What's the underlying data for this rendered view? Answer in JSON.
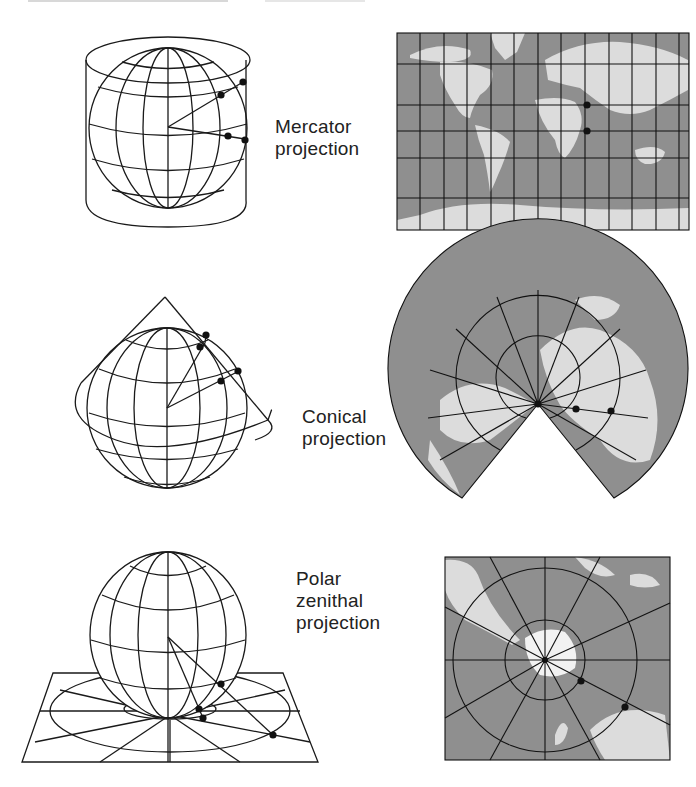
{
  "figure": {
    "rows": [
      {
        "id": "mercator",
        "label_lines": [
          "Mercator",
          "projection"
        ],
        "diagram": "globe inside tangent cylinder with projection rays",
        "map": "rectangular world map with square graticule grid"
      },
      {
        "id": "conical",
        "label_lines": [
          "Conical",
          "projection"
        ],
        "diagram": "globe under tangent cone with projection rays",
        "map": "fan-shaped conic map with radial meridians and arc parallels"
      },
      {
        "id": "polar-zenithal",
        "label_lines": [
          "Polar",
          "zenithal",
          "projection"
        ],
        "diagram": "globe resting on tangent plane with projection rays",
        "map": "square azimuthal map centered on pole with concentric circles"
      }
    ]
  },
  "colors": {
    "line": "#1a1a1a",
    "ocean": "#8f8f8f",
    "land": "#dcdcdc",
    "background": "#ffffff"
  }
}
